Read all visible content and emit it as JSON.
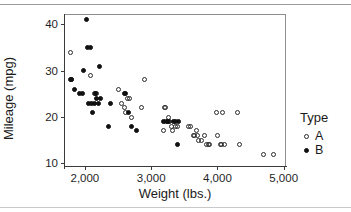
{
  "chart_data": {
    "type": "scatter",
    "title": "",
    "xlabel": "Weight (lbs.)",
    "ylabel": "Mileage (mpg)",
    "xlim": [
      1700,
      5050
    ],
    "ylim": [
      9,
      42
    ],
    "xticks": [
      2000,
      3000,
      4000,
      5000
    ],
    "xtick_labels": [
      "2,000",
      "3,000",
      "4,000",
      "5,000"
    ],
    "yticks": [
      10,
      20,
      30,
      40
    ],
    "ytick_labels": [
      "10",
      "20",
      "30",
      "40"
    ],
    "grid": false,
    "legend": {
      "title": "Type",
      "position": "right",
      "entries": [
        {
          "name": "A",
          "marker": "open-circle",
          "color": "#2b2b2b"
        },
        {
          "name": "B",
          "marker": "filled-circle",
          "color": "#111111"
        }
      ]
    },
    "series": [
      {
        "name": "A",
        "marker": "open-circle",
        "points": [
          [
            1780,
            34
          ],
          [
            1800,
            28
          ],
          [
            2090,
            29
          ],
          [
            2150,
            25
          ],
          [
            2160,
            25
          ],
          [
            2180,
            25
          ],
          [
            2500,
            26
          ],
          [
            2560,
            23
          ],
          [
            2600,
            22
          ],
          [
            2620,
            21
          ],
          [
            2640,
            24
          ],
          [
            2680,
            24
          ],
          [
            2700,
            20
          ],
          [
            2860,
            22
          ],
          [
            2900,
            28
          ],
          [
            3180,
            17
          ],
          [
            3200,
            22
          ],
          [
            3210,
            22
          ],
          [
            3220,
            19
          ],
          [
            3240,
            19
          ],
          [
            3260,
            20
          ],
          [
            3280,
            19
          ],
          [
            3300,
            18
          ],
          [
            3320,
            17
          ],
          [
            3360,
            18
          ],
          [
            3400,
            18
          ],
          [
            3560,
            18
          ],
          [
            3600,
            18
          ],
          [
            3640,
            16
          ],
          [
            3660,
            16
          ],
          [
            3680,
            17
          ],
          [
            3700,
            16
          ],
          [
            3720,
            15
          ],
          [
            3760,
            15
          ],
          [
            3800,
            16
          ],
          [
            3840,
            14
          ],
          [
            3860,
            14
          ],
          [
            3880,
            14
          ],
          [
            3980,
            21
          ],
          [
            4000,
            16
          ],
          [
            4040,
            14
          ],
          [
            4060,
            14
          ],
          [
            4080,
            21
          ],
          [
            4100,
            14
          ],
          [
            4300,
            21
          ],
          [
            4340,
            14
          ],
          [
            4700,
            12
          ],
          [
            4840,
            12
          ]
        ]
      },
      {
        "name": "B",
        "marker": "filled-circle",
        "points": [
          [
            1780,
            28
          ],
          [
            1800,
            28
          ],
          [
            1840,
            26
          ],
          [
            1920,
            25
          ],
          [
            1960,
            25
          ],
          [
            1980,
            30
          ],
          [
            2020,
            41
          ],
          [
            2040,
            35
          ],
          [
            2080,
            35
          ],
          [
            2060,
            23
          ],
          [
            2100,
            23
          ],
          [
            2140,
            23
          ],
          [
            2160,
            25
          ],
          [
            2180,
            24
          ],
          [
            2200,
            23
          ],
          [
            2220,
            31
          ],
          [
            2240,
            24
          ],
          [
            2120,
            21
          ],
          [
            2380,
            23
          ],
          [
            2360,
            18
          ],
          [
            2600,
            25
          ],
          [
            2620,
            25
          ],
          [
            2660,
            21
          ],
          [
            2700,
            18
          ],
          [
            2780,
            17
          ],
          [
            3180,
            19
          ],
          [
            3240,
            19
          ],
          [
            3260,
            19
          ],
          [
            3340,
            19
          ],
          [
            3360,
            19
          ],
          [
            3400,
            14
          ],
          [
            3420,
            19
          ]
        ]
      }
    ]
  }
}
